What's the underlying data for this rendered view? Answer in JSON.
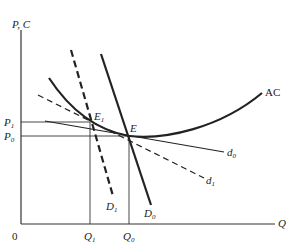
{
  "diagram": {
    "title": "",
    "axes": {
      "y_label": "P, C",
      "x_label": "Q",
      "origin_label": "0"
    },
    "price_ticks": [
      {
        "name": "P",
        "sub": "1"
      },
      {
        "name": "P",
        "sub": "0"
      }
    ],
    "quantity_ticks": [
      {
        "name": "Q",
        "sub": "1"
      },
      {
        "name": "Q",
        "sub": "0"
      }
    ],
    "curves": {
      "ac": {
        "label": "AC",
        "style": "solid-thick"
      },
      "D0": {
        "name": "D",
        "sub": "0",
        "style": "solid-thick"
      },
      "D1": {
        "name": "D",
        "sub": "1",
        "style": "dashed-thick"
      },
      "d0": {
        "name": "d",
        "sub": "0",
        "style": "solid-thin"
      },
      "d1": {
        "name": "d",
        "sub": "1",
        "style": "dashed-thin"
      }
    },
    "points": {
      "E": {
        "name": "E",
        "sub": ""
      },
      "E1": {
        "name": "E",
        "sub": "1"
      }
    },
    "colors": {
      "ink": "#222222",
      "background": "#ffffff"
    }
  }
}
